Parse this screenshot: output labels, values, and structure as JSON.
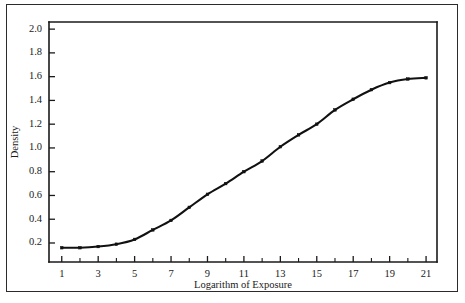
{
  "figure": {
    "has_outer_border": true,
    "background_color": "#ffffff",
    "ink_color": "#111111"
  },
  "chart_data": {
    "type": "line",
    "title": "",
    "subtitle": "",
    "xlabel": "Logarithm of Exposure",
    "ylabel": "Density",
    "xlim": [
      0.3,
      21.6
    ],
    "ylim": [
      0.04,
      2.06
    ],
    "grid": false,
    "legend": null,
    "legend_position": "none",
    "marker": "square-dot",
    "line_color": "#111111",
    "x_tick_labels": [
      "1",
      "3",
      "5",
      "7",
      "9",
      "11",
      "13",
      "15",
      "17",
      "19",
      "21"
    ],
    "x_tick_values": [
      1,
      3,
      5,
      7,
      9,
      11,
      13,
      15,
      17,
      19,
      21
    ],
    "x_minor_tick_values": [
      2,
      4,
      6,
      8,
      10,
      12,
      14,
      16,
      18,
      20
    ],
    "y_tick_labels": [
      "0.2",
      "0.4",
      "0.6",
      "0.8",
      "1.0",
      "1.2",
      "1.4",
      "1.6",
      "1.8",
      "2.0"
    ],
    "y_tick_values": [
      0.2,
      0.4,
      0.6,
      0.8,
      1.0,
      1.2,
      1.4,
      1.6,
      1.8,
      2.0
    ],
    "x": [
      1,
      2,
      3,
      4,
      5,
      6,
      7,
      8,
      9,
      10,
      11,
      12,
      13,
      14,
      15,
      16,
      17,
      18,
      19,
      20,
      21
    ],
    "values": [
      0.16,
      0.16,
      0.17,
      0.19,
      0.23,
      0.31,
      0.39,
      0.5,
      0.61,
      0.7,
      0.8,
      0.89,
      1.01,
      1.11,
      1.2,
      1.32,
      1.41,
      1.49,
      1.55,
      1.58,
      1.59
    ],
    "annotations": []
  },
  "axis_labels": {
    "x_title": "Logarithm of Exposure",
    "y_title": "Density"
  }
}
